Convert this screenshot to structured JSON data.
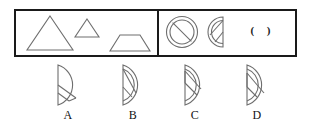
{
  "puzzle": {
    "type": "visual-analogy-multiple-choice",
    "question_group": {
      "left_panel": {
        "name": "premise-figures",
        "figures": [
          {
            "id": "large-triangle",
            "shape": "triangle",
            "size": "large"
          },
          {
            "id": "small-triangle",
            "shape": "triangle",
            "size": "small"
          },
          {
            "id": "trapezoid",
            "shape": "trapezoid",
            "size": "medium"
          }
        ]
      },
      "right_panel": {
        "name": "answer-figures",
        "figures": [
          {
            "id": "circle-with-slash",
            "shape": "circle-double-ring-diagonal",
            "size": "large"
          },
          {
            "id": "half-circle-slash",
            "shape": "half-circle-double-ring-diagonal",
            "size": "medium"
          },
          {
            "id": "blank-slot",
            "shape": "blank",
            "text": "(  )"
          }
        ]
      }
    },
    "options": [
      {
        "label": "A",
        "name": "option-a",
        "shape": "half-circle-single-ring-inner-triangle",
        "flat_side": "left"
      },
      {
        "label": "B",
        "name": "option-b",
        "shape": "half-circle-double-ring-inner-diagonal",
        "flat_side": "left"
      },
      {
        "label": "C",
        "name": "option-c",
        "shape": "half-circle-double-ring-inner-triangle-wide",
        "flat_side": "left"
      },
      {
        "label": "D",
        "name": "option-d",
        "shape": "half-circle-double-ring-inner-triangle",
        "flat_side": "left"
      }
    ],
    "colors": {
      "box_border": "#1a1a1a",
      "figure_stroke": "#6e6e6e",
      "label_text": "#111111",
      "background": "#ffffff"
    }
  }
}
